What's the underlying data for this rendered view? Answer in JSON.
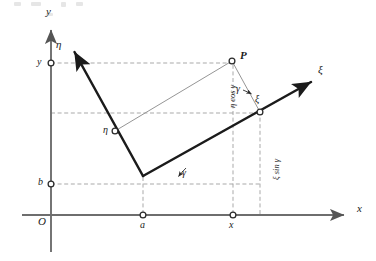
{
  "figure": {
    "type": "geometry-diagram",
    "background": "#ffffff",
    "ink_color": "#1b1b1b",
    "axis_color": "#6e6e6e",
    "dash_color": "#8a8a8a",
    "thin_color": "#8f8f8f",
    "size": {
      "width": 376,
      "height": 261
    }
  },
  "axes": {
    "x_axis": {
      "label": "x",
      "label_pos": {
        "x": 358,
        "y": 208
      },
      "start": {
        "x": 22,
        "y": 215
      },
      "end": {
        "x": 349,
        "y": 215
      }
    },
    "y_axis": {
      "label": "y",
      "label_pos": {
        "x": 46,
        "y": 12
      },
      "start": {
        "x": 51,
        "y": 252
      },
      "end": {
        "x": 51,
        "y": 25
      }
    },
    "xi_axis": {
      "label": "ξ",
      "label_pos": {
        "x": 319,
        "y": 68
      },
      "start": {
        "x": 143,
        "y": 176
      },
      "end": {
        "x": 316,
        "y": 79
      }
    },
    "eta_axis": {
      "label": "η",
      "label_pos": {
        "x": 57,
        "y": 44
      },
      "start": {
        "x": 143,
        "y": 176
      },
      "end": {
        "x": 72,
        "y": 48
      }
    },
    "origin_label": "O",
    "origin_label_pos": {
      "x": 39,
      "y": 217
    }
  },
  "points": {
    "P": {
      "label": "P",
      "label_pos": {
        "x": 241,
        "y": 50
      },
      "pos": {
        "x": 232,
        "y": 61
      }
    },
    "a": {
      "label": "a",
      "label_pos": {
        "x": 140,
        "y": 221
      },
      "pos": {
        "x": 143,
        "y": 215
      }
    },
    "b": {
      "label": "b",
      "label_pos": {
        "x": 39,
        "y": 178
      },
      "pos": {
        "x": 51,
        "y": 184
      }
    },
    "x_foot": {
      "label": "x",
      "label_pos": {
        "x": 230,
        "y": 221
      },
      "pos": {
        "x": 233,
        "y": 215
      }
    },
    "y_foot": {
      "label": "y",
      "label_pos": {
        "x": 38,
        "y": 57
      },
      "pos": {
        "x": 51,
        "y": 63
      }
    },
    "xi_foot": {
      "label": "ξ",
      "label_pos": {
        "x": 256,
        "y": 96
      },
      "pos": {
        "x": 260,
        "y": 112
      }
    },
    "eta_foot": {
      "label": "η",
      "label_pos": {
        "x": 104,
        "y": 127
      },
      "pos": {
        "x": 115,
        "y": 131
      }
    }
  },
  "angles": {
    "gamma_lower": {
      "label": "γ",
      "label_pos": {
        "x": 183,
        "y": 170
      }
    },
    "gamma_upper": {
      "label": "γ",
      "label_pos": {
        "x": 238,
        "y": 86
      }
    }
  },
  "segments": {
    "eta_cos_gamma": {
      "label": "η cos γ",
      "anchor": {
        "x": 228,
        "y": 107
      },
      "rotation_deg": -90
    },
    "xi_sin_gamma": {
      "label": "ξ sin γ",
      "anchor": {
        "x": 272,
        "y": 178
      },
      "rotation_deg": -90
    }
  }
}
